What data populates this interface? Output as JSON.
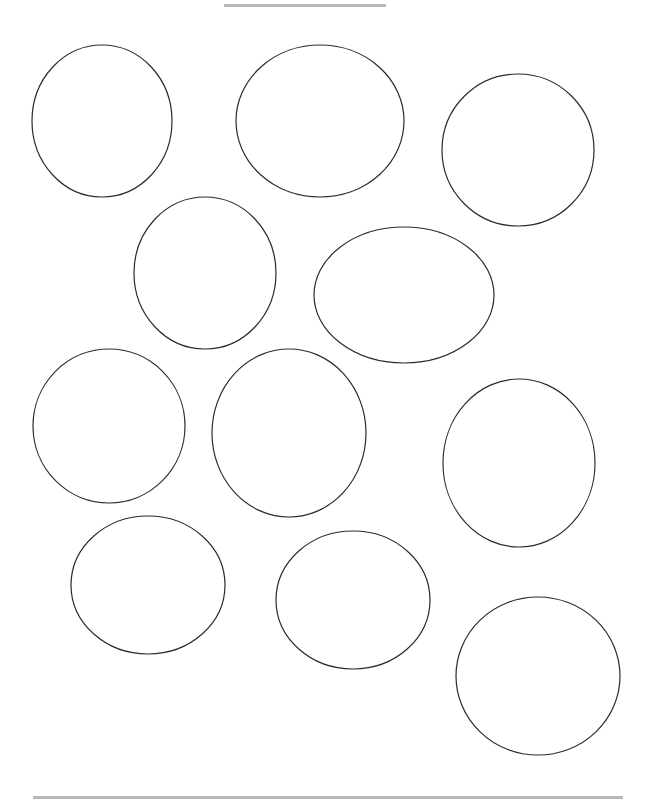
{
  "page": {
    "width": 650,
    "height": 804,
    "background": "#ffffff"
  },
  "top_bar": {
    "x": 224,
    "y": 4,
    "width": 162,
    "height": 3,
    "color": "#b9b9b9"
  },
  "bottom_bar": {
    "x": 33,
    "y": 796,
    "width": 590,
    "height": 3,
    "color": "#b9b9b9"
  },
  "stroke": {
    "color": "#2b2b2b",
    "width": 1.2
  },
  "shapes": [
    {
      "name": "circle-1",
      "cx": 102,
      "cy": 121,
      "rx": 70,
      "ry": 76
    },
    {
      "name": "circle-2",
      "cx": 320,
      "cy": 121,
      "rx": 84,
      "ry": 76
    },
    {
      "name": "circle-3",
      "cx": 518,
      "cy": 150,
      "rx": 76,
      "ry": 76
    },
    {
      "name": "circle-4",
      "cx": 205,
      "cy": 273,
      "rx": 71,
      "ry": 76
    },
    {
      "name": "circle-5",
      "cx": 404,
      "cy": 295,
      "rx": 90,
      "ry": 68
    },
    {
      "name": "circle-6",
      "cx": 109,
      "cy": 426,
      "rx": 76,
      "ry": 77
    },
    {
      "name": "circle-7",
      "cx": 289,
      "cy": 433,
      "rx": 77,
      "ry": 84
    },
    {
      "name": "circle-8",
      "cx": 519,
      "cy": 463,
      "rx": 76,
      "ry": 84
    },
    {
      "name": "circle-9",
      "cx": 148,
      "cy": 585,
      "rx": 77,
      "ry": 69
    },
    {
      "name": "circle-10",
      "cx": 353,
      "cy": 600,
      "rx": 77,
      "ry": 69
    },
    {
      "name": "circle-11",
      "cx": 538,
      "cy": 676,
      "rx": 82,
      "ry": 79
    }
  ]
}
